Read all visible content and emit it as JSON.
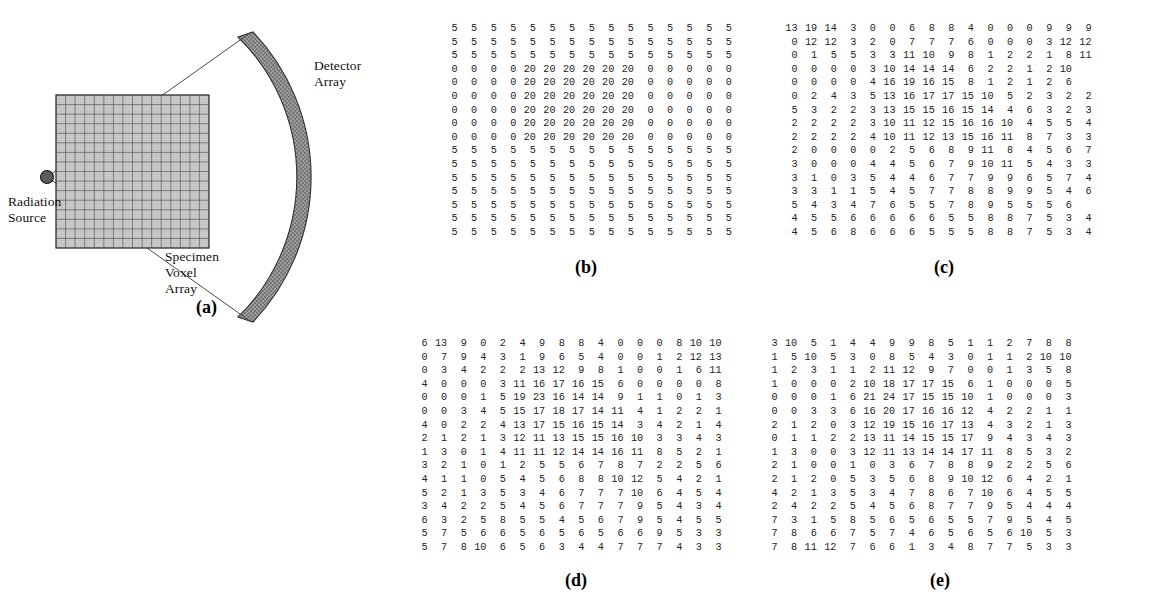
{
  "figure": {
    "panel_a": {
      "caption": "(a)",
      "labels": {
        "detector": "Detector\nArray",
        "source": "Radiation\nSource",
        "specimen": "Specimen\nVoxel\nArray"
      },
      "colors": {
        "detector_fill": "#8a8a8a",
        "voxel_fill": "#c9c9c9",
        "source_fill": "#5c5c5c",
        "line": "#3a3a3a"
      },
      "voxel_grid": {
        "rows": 16,
        "cols": 16
      }
    },
    "panel_b": {
      "caption": "(b)",
      "rows": 16,
      "cols": 15,
      "values": [
        [
          5,
          5,
          5,
          5,
          5,
          5,
          5,
          5,
          5,
          5,
          5,
          5,
          5,
          5,
          5
        ],
        [
          5,
          5,
          5,
          5,
          5,
          5,
          5,
          5,
          5,
          5,
          5,
          5,
          5,
          5,
          5
        ],
        [
          5,
          5,
          5,
          5,
          5,
          5,
          5,
          5,
          5,
          5,
          5,
          5,
          5,
          5,
          5
        ],
        [
          0,
          0,
          0,
          0,
          20,
          20,
          20,
          20,
          20,
          20,
          0,
          0,
          0,
          0,
          0
        ],
        [
          0,
          0,
          0,
          0,
          20,
          20,
          20,
          20,
          20,
          20,
          0,
          0,
          0,
          0,
          0
        ],
        [
          0,
          0,
          0,
          0,
          20,
          20,
          20,
          20,
          20,
          20,
          0,
          0,
          0,
          0,
          0
        ],
        [
          0,
          0,
          0,
          0,
          20,
          20,
          20,
          20,
          20,
          20,
          0,
          0,
          0,
          0,
          0
        ],
        [
          0,
          0,
          0,
          0,
          20,
          20,
          20,
          20,
          20,
          20,
          0,
          0,
          0,
          0,
          0
        ],
        [
          0,
          0,
          0,
          0,
          20,
          20,
          20,
          20,
          20,
          20,
          0,
          0,
          0,
          0,
          0
        ],
        [
          5,
          5,
          5,
          5,
          5,
          5,
          5,
          5,
          5,
          5,
          5,
          5,
          5,
          5,
          5
        ],
        [
          5,
          5,
          5,
          5,
          5,
          5,
          5,
          5,
          5,
          5,
          5,
          5,
          5,
          5,
          5
        ],
        [
          5,
          5,
          5,
          5,
          5,
          5,
          5,
          5,
          5,
          5,
          5,
          5,
          5,
          5,
          5
        ],
        [
          5,
          5,
          5,
          5,
          5,
          5,
          5,
          5,
          5,
          5,
          5,
          5,
          5,
          5,
          5
        ],
        [
          5,
          5,
          5,
          5,
          5,
          5,
          5,
          5,
          5,
          5,
          5,
          5,
          5,
          5,
          5
        ],
        [
          5,
          5,
          5,
          5,
          5,
          5,
          5,
          5,
          5,
          5,
          5,
          5,
          5,
          5,
          5
        ],
        [
          5,
          5,
          5,
          5,
          5,
          5,
          5,
          5,
          5,
          5,
          5,
          5,
          5,
          5,
          5
        ]
      ]
    },
    "panel_c": {
      "caption": "(c)",
      "rows": 16,
      "cols": 15,
      "values": [
        [
          13,
          19,
          14,
          3,
          0,
          0,
          6,
          8,
          8,
          4,
          0,
          0,
          0,
          9,
          9,
          9
        ],
        [
          0,
          12,
          12,
          3,
          2,
          0,
          7,
          7,
          7,
          6,
          0,
          0,
          0,
          3,
          12,
          12
        ],
        [
          0,
          1,
          5,
          5,
          3,
          3,
          11,
          10,
          9,
          8,
          1,
          2,
          2,
          1,
          8,
          11
        ],
        [
          0,
          0,
          0,
          0,
          3,
          10,
          14,
          14,
          14,
          6,
          2,
          2,
          1,
          2,
          10
        ],
        [
          0,
          0,
          0,
          0,
          4,
          16,
          19,
          16,
          15,
          8,
          1,
          2,
          1,
          2,
          6
        ],
        [
          0,
          2,
          4,
          3,
          5,
          13,
          16,
          17,
          17,
          15,
          10,
          5,
          2,
          3,
          2,
          2
        ],
        [
          5,
          3,
          2,
          2,
          3,
          13,
          15,
          15,
          16,
          15,
          14,
          4,
          6,
          3,
          2,
          3
        ],
        [
          2,
          2,
          2,
          2,
          3,
          10,
          11,
          12,
          15,
          16,
          16,
          10,
          4,
          5,
          5,
          4
        ],
        [
          2,
          2,
          2,
          2,
          4,
          10,
          11,
          12,
          13,
          15,
          16,
          11,
          8,
          7,
          3,
          3
        ],
        [
          2,
          0,
          0,
          0,
          0,
          2,
          5,
          6,
          8,
          9,
          11,
          8,
          4,
          5,
          6,
          7
        ],
        [
          3,
          0,
          0,
          0,
          4,
          4,
          5,
          6,
          7,
          9,
          10,
          11,
          5,
          4,
          3,
          3
        ],
        [
          3,
          1,
          0,
          3,
          5,
          4,
          4,
          6,
          7,
          7,
          9,
          9,
          6,
          5,
          7,
          4
        ],
        [
          3,
          3,
          1,
          1,
          5,
          4,
          5,
          7,
          7,
          8,
          8,
          9,
          9,
          5,
          4,
          6
        ],
        [
          5,
          4,
          3,
          4,
          7,
          6,
          5,
          5,
          7,
          8,
          9,
          5,
          5,
          5,
          6
        ],
        [
          4,
          5,
          5,
          6,
          6,
          6,
          6,
          6,
          5,
          5,
          8,
          8,
          7,
          5,
          3,
          4
        ],
        [
          4,
          5,
          6,
          8,
          6,
          6,
          6,
          5,
          5,
          5,
          8,
          8,
          7,
          5,
          3,
          4
        ]
      ]
    },
    "panel_d": {
      "caption": "(d)",
      "rows": 16,
      "cols": 16,
      "values": [
        [
          6,
          13,
          9,
          0,
          2,
          4,
          9,
          8,
          8,
          4,
          0,
          0,
          0,
          8,
          10,
          10
        ],
        [
          0,
          7,
          9,
          4,
          3,
          1,
          9,
          6,
          5,
          4,
          0,
          0,
          1,
          2,
          12,
          13
        ],
        [
          0,
          3,
          4,
          2,
          2,
          2,
          13,
          12,
          9,
          8,
          1,
          0,
          0,
          1,
          6,
          11
        ],
        [
          4,
          0,
          0,
          0,
          3,
          11,
          16,
          17,
          16,
          15,
          6,
          0,
          0,
          0,
          0,
          8
        ],
        [
          0,
          0,
          0,
          1,
          5,
          19,
          23,
          16,
          14,
          14,
          9,
          1,
          1,
          0,
          1,
          3
        ],
        [
          0,
          0,
          3,
          4,
          5,
          15,
          17,
          18,
          17,
          14,
          11,
          4,
          1,
          2,
          2,
          1
        ],
        [
          4,
          0,
          2,
          2,
          4,
          13,
          17,
          15,
          16,
          15,
          14,
          3,
          4,
          2,
          1,
          4
        ],
        [
          2,
          1,
          2,
          1,
          3,
          12,
          11,
          13,
          15,
          15,
          16,
          10,
          3,
          3,
          4,
          3
        ],
        [
          1,
          3,
          0,
          1,
          4,
          11,
          11,
          12,
          14,
          14,
          16,
          11,
          8,
          5,
          2,
          1
        ],
        [
          3,
          2,
          1,
          0,
          1,
          2,
          5,
          5,
          6,
          7,
          8,
          7,
          2,
          2,
          5,
          6
        ],
        [
          4,
          1,
          1,
          0,
          5,
          4,
          5,
          6,
          8,
          8,
          10,
          12,
          5,
          4,
          2,
          1
        ],
        [
          5,
          2,
          1,
          3,
          5,
          3,
          4,
          6,
          7,
          7,
          7,
          10,
          6,
          4,
          5,
          4
        ],
        [
          3,
          4,
          2,
          2,
          5,
          4,
          5,
          6,
          7,
          7,
          7,
          9,
          5,
          4,
          3,
          4
        ],
        [
          6,
          3,
          2,
          5,
          8,
          5,
          5,
          4,
          5,
          6,
          7,
          9,
          5,
          4,
          5,
          5
        ],
        [
          5,
          7,
          5,
          6,
          6,
          5,
          6,
          5,
          6,
          5,
          6,
          6,
          9,
          5,
          3,
          3
        ],
        [
          5,
          7,
          8,
          10,
          6,
          5,
          6,
          3,
          4,
          4,
          7,
          7,
          7,
          4,
          3,
          3
        ]
      ]
    },
    "panel_e": {
      "caption": "(e)",
      "rows": 16,
      "cols": 16,
      "values": [
        [
          3,
          10,
          5,
          1,
          4,
          4,
          9,
          9,
          8,
          5,
          1,
          1,
          2,
          7,
          8,
          8
        ],
        [
          1,
          5,
          10,
          5,
          3,
          0,
          8,
          5,
          4,
          3,
          0,
          1,
          1,
          2,
          10,
          10
        ],
        [
          1,
          2,
          3,
          1,
          1,
          2,
          11,
          12,
          9,
          7,
          0,
          0,
          1,
          3,
          5,
          8
        ],
        [
          1,
          0,
          0,
          0,
          2,
          10,
          18,
          17,
          17,
          15,
          6,
          1,
          0,
          0,
          0,
          5
        ],
        [
          0,
          0,
          0,
          1,
          6,
          21,
          24,
          17,
          15,
          15,
          10,
          1,
          0,
          0,
          0,
          3
        ],
        [
          0,
          0,
          3,
          3,
          6,
          16,
          20,
          17,
          16,
          16,
          12,
          4,
          2,
          2,
          1,
          1
        ],
        [
          2,
          1,
          2,
          0,
          3,
          12,
          19,
          15,
          16,
          17,
          13,
          4,
          3,
          2,
          1,
          3
        ],
        [
          0,
          1,
          1,
          2,
          2,
          13,
          11,
          14,
          15,
          15,
          17,
          9,
          4,
          3,
          4,
          3
        ],
        [
          1,
          3,
          0,
          0,
          3,
          12,
          11,
          13,
          14,
          14,
          17,
          11,
          8,
          5,
          3,
          2
        ],
        [
          2,
          1,
          0,
          0,
          1,
          0,
          3,
          6,
          7,
          8,
          8,
          9,
          2,
          2,
          5,
          6
        ],
        [
          2,
          1,
          2,
          0,
          5,
          3,
          5,
          6,
          8,
          9,
          10,
          12,
          6,
          4,
          2,
          1
        ],
        [
          4,
          2,
          1,
          3,
          5,
          3,
          4,
          7,
          8,
          6,
          7,
          10,
          6,
          4,
          5,
          5
        ],
        [
          2,
          4,
          2,
          2,
          5,
          4,
          5,
          6,
          8,
          7,
          7,
          9,
          5,
          4,
          4,
          4
        ],
        [
          7,
          3,
          1,
          5,
          8,
          5,
          6,
          5,
          6,
          5,
          5,
          7,
          9,
          5,
          4,
          5
        ],
        [
          7,
          8,
          6,
          6,
          7,
          5,
          7,
          4,
          6,
          5,
          6,
          5,
          6,
          10,
          5,
          3
        ],
        [
          7,
          8,
          11,
          12,
          7,
          6,
          6,
          1,
          3,
          4,
          8,
          7,
          7,
          5,
          3,
          3
        ]
      ]
    }
  }
}
